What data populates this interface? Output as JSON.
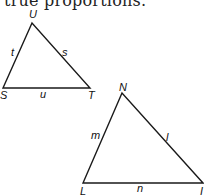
{
  "caption": "true proportions.",
  "triangles": [
    {
      "name": "STU",
      "vertices": [
        {
          "label": "U",
          "x": 32,
          "y": 23,
          "lx": 29,
          "ly": 18
        },
        {
          "label": "S",
          "x": 3,
          "y": 88,
          "lx": 0,
          "ly": 99
        },
        {
          "label": "T",
          "x": 90,
          "y": 88,
          "lx": 88,
          "ly": 99
        }
      ],
      "sides": [
        {
          "label": "t",
          "lx": 11,
          "ly": 56
        },
        {
          "label": "s",
          "lx": 62,
          "ly": 56
        },
        {
          "label": "u",
          "lx": 40,
          "ly": 98
        }
      ]
    },
    {
      "name": "LMN",
      "vertices": [
        {
          "label": "N",
          "x": 122,
          "y": 93,
          "lx": 119,
          "ly": 91
        },
        {
          "label": "L",
          "x": 83,
          "y": 183,
          "lx": 80,
          "ly": 195
        },
        {
          "label": "I",
          "x": 203,
          "y": 183,
          "lx": 200,
          "ly": 195
        }
      ],
      "sides": [
        {
          "label": "m",
          "lx": 91,
          "ly": 139
        },
        {
          "label": "l",
          "lx": 166,
          "ly": 141
        },
        {
          "label": "n",
          "lx": 137,
          "ly": 192
        }
      ]
    }
  ],
  "colors": {
    "stroke": "#1a1a1a"
  }
}
